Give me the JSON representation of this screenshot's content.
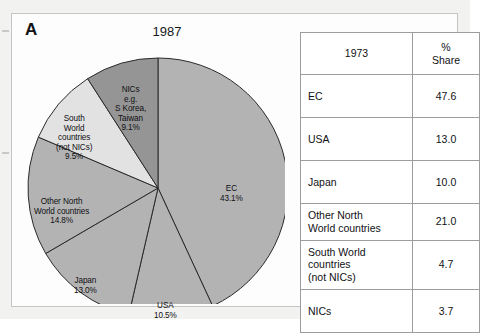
{
  "figure": {
    "panel_letter": "A",
    "chart_title": "1987"
  },
  "chart_data": {
    "type": "pie",
    "title": "1987",
    "xlabel": "",
    "ylabel": "",
    "units": "percent share",
    "legend": "none (labels drawn on slices)",
    "start_angle_deg": 0,
    "direction": "clockwise",
    "categories": [
      "EC",
      "USA",
      "Japan",
      "Other North World countries",
      "South World countries (not NICs)",
      "NICs e.g. S Korea, Taiwan"
    ],
    "values": [
      43.1,
      10.5,
      13.0,
      14.8,
      9.5,
      9.1
    ],
    "slices": [
      {
        "name": "EC",
        "value": 43.1,
        "label_line1": "EC",
        "label_line2": "43.1%",
        "color": "#b3b3b3"
      },
      {
        "name": "USA",
        "value": 10.5,
        "label_line1": "USA",
        "label_line2": "10.5%",
        "color": "#b3b3b3"
      },
      {
        "name": "Japan",
        "value": 13.0,
        "label_line1": "Japan",
        "label_line2": "13.0%",
        "color": "#b3b3b3"
      },
      {
        "name": "Other North World countries",
        "value": 14.8,
        "label_line1": "Other  North",
        "label_line2": "World  countries",
        "label_line3": "14.8%",
        "color": "#b3b3b3"
      },
      {
        "name": "South World countries (not NICs)",
        "value": 9.5,
        "label_line1": "South",
        "label_line2": "World",
        "label_line3": "countries",
        "label_line4": "(not  NICs)",
        "label_line5": "9.5%",
        "color": "#e2e2e2"
      },
      {
        "name": "NICs e.g. S Korea, Taiwan",
        "value": 9.1,
        "label_line1": "NICs",
        "label_line2": "e.g.",
        "label_line3": "S  Korea,",
        "label_line4": "Taiwan",
        "label_line5": "9.1%",
        "color": "#959595"
      }
    ]
  },
  "table": {
    "header": {
      "category": "1973",
      "value_line1": "%",
      "value_line2": "Share"
    },
    "rows": [
      {
        "category": "EC",
        "value": "47.6"
      },
      {
        "category": "USA",
        "value": "13.0"
      },
      {
        "category": "Japan",
        "value": "10.0"
      },
      {
        "category_line1": "Other  North",
        "category_line2": "World  countries",
        "value": "21.0"
      },
      {
        "category_line1": "South  World",
        "category_line2": "countries",
        "category_line3": "(not  NICs)",
        "value": "4.7"
      },
      {
        "category": "NICs",
        "value": "3.7"
      }
    ]
  },
  "colors": {
    "slice_default": "#b3b3b3",
    "slice_light": "#e2e2e2",
    "slice_dark": "#959595",
    "outline": "#2b2b2b",
    "table_border": "#9d9d9d",
    "panel_border": "#c5c5c5",
    "page_background": "#f2f2f0"
  }
}
